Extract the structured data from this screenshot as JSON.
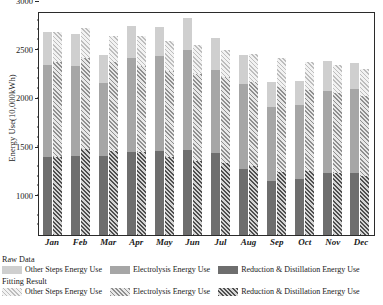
{
  "chart_data": {
    "type": "bar",
    "title": "",
    "xlabel": "",
    "ylabel": "Energy Use(10,000kWh)",
    "ylim": [
      700,
      3000
    ],
    "yticks": [
      1000,
      1500,
      2000,
      2500,
      3000
    ],
    "ytick_labels": [
      "1000",
      "1500",
      "2000",
      "2500",
      "3000"
    ],
    "grid": false,
    "legend_position": "below-axes",
    "stacked": true,
    "grouped": true,
    "categories": [
      "Jan",
      "Feb",
      "Mar",
      "Apr",
      "May",
      "Jun",
      "Jul",
      "Aug",
      "Sep",
      "Oct",
      "Nov",
      "Dec"
    ],
    "group_labels": [
      "Raw Data",
      "Fitting Result"
    ],
    "series": [
      {
        "name": "Reduction & Distillation Energy Use",
        "group": "Raw Data",
        "style": "solid",
        "color": "#6e6e6e",
        "values": [
          1075,
          1090,
          1120,
          1125,
          1150,
          1145,
          1130,
          935,
          795,
          835,
          885,
          885
        ]
      },
      {
        "name": "Electrolysis Energy Use",
        "group": "Raw Data",
        "style": "solid",
        "color": "#a6a6a6",
        "values": [
          1255,
          1240,
          1040,
          1290,
          1285,
          1350,
          1150,
          1205,
          1100,
          1095,
          1170,
          1210
        ]
      },
      {
        "name": "Other Steps Energy Use",
        "group": "Raw Data",
        "style": "solid",
        "color": "#cfcfcf",
        "values": [
          455,
          435,
          385,
          430,
          405,
          430,
          445,
          405,
          380,
          350,
          430,
          375
        ]
      },
      {
        "name": "Reduction & Distillation Energy Use",
        "group": "Fitting Result",
        "style": "hatched",
        "color": "#4f4f4f",
        "values": [
          1070,
          1180,
          1155,
          1140,
          1085,
          1035,
          1015,
          980,
          900,
          920,
          890,
          860
        ]
      },
      {
        "name": "Electrolysis Energy Use",
        "group": "Fitting Result",
        "style": "hatched",
        "color": "#8f8f8f",
        "values": [
          1300,
          1240,
          1225,
          1190,
          1195,
          1215,
          1200,
          1180,
          1205,
          1155,
          1160,
          1160
        ]
      },
      {
        "name": "Other Steps Energy Use",
        "group": "Fitting Result",
        "style": "hatched",
        "color": "#bdbdbd",
        "values": [
          415,
          410,
          365,
          415,
          415,
          400,
          390,
          395,
          415,
          400,
          395,
          380
        ]
      }
    ],
    "totals_raw": [
      2785,
      2765,
      2545,
      2845,
      2840,
      2925,
      2725,
      2545,
      2275,
      2280,
      2485,
      2470
    ],
    "totals_fit": [
      2785,
      2830,
      2745,
      2745,
      2695,
      2650,
      2605,
      2555,
      2520,
      2475,
      2445,
      2400
    ]
  },
  "legend": {
    "raw_title": "Raw Data",
    "fitting_title": "Fitting Result",
    "items_raw": [
      "Other Steps Energy Use",
      "Electrolysis Energy Use",
      "Reduction & Distillation Energy Use"
    ],
    "items_fitting": [
      "Other Steps Energy Use",
      "Electrolysis Energy Use",
      "Reduction & Distillation Energy Use"
    ]
  }
}
